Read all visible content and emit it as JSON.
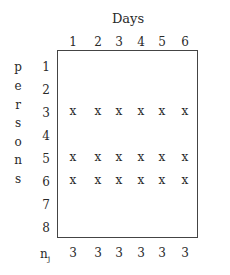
{
  "diagram": {
    "title": "Days",
    "row_axis_label_letters": [
      "p",
      "e",
      "r",
      "s",
      "o",
      "n",
      "s"
    ],
    "columns": [
      "1",
      "2",
      "3",
      "4",
      "5",
      "6"
    ],
    "rows": [
      "1",
      "2",
      "3",
      "4",
      "5",
      "6",
      "7",
      "8"
    ],
    "mark_symbol": "x",
    "marked_rows": [
      "3",
      "5",
      "6"
    ],
    "cells": [
      [
        "",
        "",
        "",
        "",
        "",
        ""
      ],
      [
        "",
        "",
        "",
        "",
        "",
        ""
      ],
      [
        "x",
        "x",
        "x",
        "x",
        "x",
        "x"
      ],
      [
        "",
        "",
        "",
        "",
        "",
        ""
      ],
      [
        "x",
        "x",
        "x",
        "x",
        "x",
        "x"
      ],
      [
        "x",
        "x",
        "x",
        "x",
        "x",
        "x"
      ],
      [
        "",
        "",
        "",
        "",
        "",
        ""
      ],
      [
        "",
        "",
        "",
        "",
        "",
        ""
      ]
    ],
    "footer": {
      "label_main": "n",
      "label_sub": "j",
      "values": [
        "3",
        "3",
        "3",
        "3",
        "3",
        "3"
      ]
    }
  }
}
